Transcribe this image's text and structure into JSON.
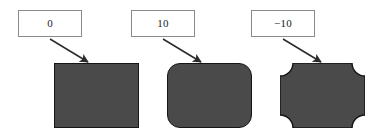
{
  "figure": {
    "background_color": "#ffffff",
    "shape_fill_color": "#4a4a4a",
    "shape_stroke_color": "#151515",
    "box_border_color": "#8a8a8a",
    "arrow_color": "#2b2b2b"
  },
  "items": [
    {
      "label": "0",
      "value": 0,
      "shape_kind": "sharp-rectangle",
      "corner_radius": 0,
      "arrow": {
        "from_x": 50,
        "from_y": 39,
        "to_x": 88,
        "to_y": 62
      }
    },
    {
      "label": "10",
      "value": 10,
      "shape_kind": "rounded-rectangle",
      "corner_radius": 13,
      "arrow": {
        "from_x": 163,
        "from_y": 39,
        "to_x": 201,
        "to_y": 62
      }
    },
    {
      "label": "−10",
      "value": -10,
      "shape_kind": "concave-corner-rectangle",
      "corner_radius": -13,
      "arrow": {
        "from_x": 283,
        "from_y": 39,
        "to_x": 321,
        "to_y": 62
      }
    }
  ]
}
